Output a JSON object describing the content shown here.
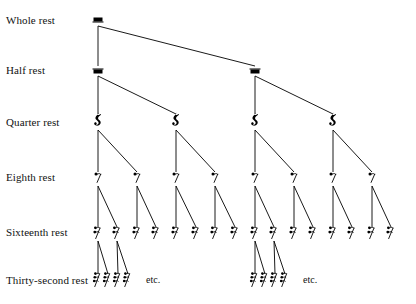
{
  "diagram": {
    "background_color": "#ffffff",
    "ink_color": "#000000",
    "width": 416,
    "height": 304,
    "rows": [
      {
        "id": "whole",
        "label": "Whole rest",
        "glyph": "whole-rest",
        "label_x": 6,
        "label_y": 26,
        "y": 21,
        "count": 1,
        "x_positions": [
          98
        ]
      },
      {
        "id": "half",
        "label": "Half rest",
        "glyph": "half-rest",
        "label_x": 6,
        "label_y": 76,
        "y": 71,
        "count": 2,
        "x_positions": [
          98,
          255
        ]
      },
      {
        "id": "quarter",
        "label": "Quarter rest",
        "glyph": "quarter-rest",
        "label_x": 6,
        "label_y": 128,
        "y": 122,
        "count": 4,
        "x_positions": [
          98,
          176,
          255,
          333
        ]
      },
      {
        "id": "eighth",
        "label": "Eighth rest",
        "glyph": "eighth-rest",
        "label_x": 6,
        "label_y": 183,
        "y": 178,
        "count": 8,
        "x_positions": [
          98,
          137,
          176,
          215,
          255,
          294,
          333,
          372
        ]
      },
      {
        "id": "sixteenth",
        "label": "Sixteenth rest",
        "glyph": "sixteenth-rest",
        "label_x": 6,
        "label_y": 238,
        "y": 233,
        "count": 16,
        "x_positions": [
          98,
          117,
          137,
          156,
          176,
          196,
          215,
          235,
          255,
          274,
          294,
          313,
          333,
          352,
          372,
          391
        ]
      },
      {
        "id": "thirtysecond",
        "label": "Thirty-second rest",
        "glyph": "thirtysecond-rest",
        "label_x": 6,
        "label_y": 286,
        "y": 280,
        "count": 8,
        "x_positions": [
          98,
          108,
          118,
          128,
          255,
          265,
          275,
          285
        ]
      }
    ],
    "etc_labels": [
      {
        "text": "etc.",
        "x": 146,
        "y": 285
      },
      {
        "text": "etc.",
        "x": 303,
        "y": 285
      }
    ],
    "edges": [
      {
        "from": [
          98,
          26
        ],
        "to": [
          98,
          66
        ]
      },
      {
        "from": [
          98,
          26
        ],
        "to": [
          255,
          66
        ]
      },
      {
        "from": [
          98,
          76
        ],
        "to": [
          98,
          114
        ]
      },
      {
        "from": [
          98,
          76
        ],
        "to": [
          176,
          114
        ]
      },
      {
        "from": [
          255,
          76
        ],
        "to": [
          255,
          114
        ]
      },
      {
        "from": [
          255,
          76
        ],
        "to": [
          333,
          114
        ]
      },
      {
        "from": [
          98,
          130
        ],
        "to": [
          98,
          172
        ]
      },
      {
        "from": [
          98,
          130
        ],
        "to": [
          137,
          172
        ]
      },
      {
        "from": [
          176,
          130
        ],
        "to": [
          176,
          172
        ]
      },
      {
        "from": [
          176,
          130
        ],
        "to": [
          215,
          172
        ]
      },
      {
        "from": [
          255,
          130
        ],
        "to": [
          255,
          172
        ]
      },
      {
        "from": [
          255,
          130
        ],
        "to": [
          294,
          172
        ]
      },
      {
        "from": [
          333,
          130
        ],
        "to": [
          333,
          172
        ]
      },
      {
        "from": [
          333,
          130
        ],
        "to": [
          372,
          172
        ]
      },
      {
        "from": [
          98,
          186
        ],
        "to": [
          98,
          227
        ]
      },
      {
        "from": [
          98,
          186
        ],
        "to": [
          117,
          227
        ]
      },
      {
        "from": [
          137,
          186
        ],
        "to": [
          137,
          227
        ]
      },
      {
        "from": [
          137,
          186
        ],
        "to": [
          156,
          227
        ]
      },
      {
        "from": [
          176,
          186
        ],
        "to": [
          176,
          227
        ]
      },
      {
        "from": [
          176,
          186
        ],
        "to": [
          196,
          227
        ]
      },
      {
        "from": [
          215,
          186
        ],
        "to": [
          215,
          227
        ]
      },
      {
        "from": [
          215,
          186
        ],
        "to": [
          235,
          227
        ]
      },
      {
        "from": [
          255,
          186
        ],
        "to": [
          255,
          227
        ]
      },
      {
        "from": [
          255,
          186
        ],
        "to": [
          274,
          227
        ]
      },
      {
        "from": [
          294,
          186
        ],
        "to": [
          294,
          227
        ]
      },
      {
        "from": [
          294,
          186
        ],
        "to": [
          313,
          227
        ]
      },
      {
        "from": [
          333,
          186
        ],
        "to": [
          333,
          227
        ]
      },
      {
        "from": [
          333,
          186
        ],
        "to": [
          352,
          227
        ]
      },
      {
        "from": [
          372,
          186
        ],
        "to": [
          372,
          227
        ]
      },
      {
        "from": [
          372,
          186
        ],
        "to": [
          391,
          227
        ]
      },
      {
        "from": [
          98,
          241
        ],
        "to": [
          98,
          274
        ]
      },
      {
        "from": [
          98,
          241
        ],
        "to": [
          108,
          274
        ]
      },
      {
        "from": [
          117,
          241
        ],
        "to": [
          118,
          274
        ]
      },
      {
        "from": [
          117,
          241
        ],
        "to": [
          128,
          274
        ]
      },
      {
        "from": [
          255,
          241
        ],
        "to": [
          255,
          274
        ]
      },
      {
        "from": [
          255,
          241
        ],
        "to": [
          265,
          274
        ]
      },
      {
        "from": [
          274,
          241
        ],
        "to": [
          275,
          274
        ]
      },
      {
        "from": [
          274,
          241
        ],
        "to": [
          285,
          274
        ]
      }
    ]
  }
}
